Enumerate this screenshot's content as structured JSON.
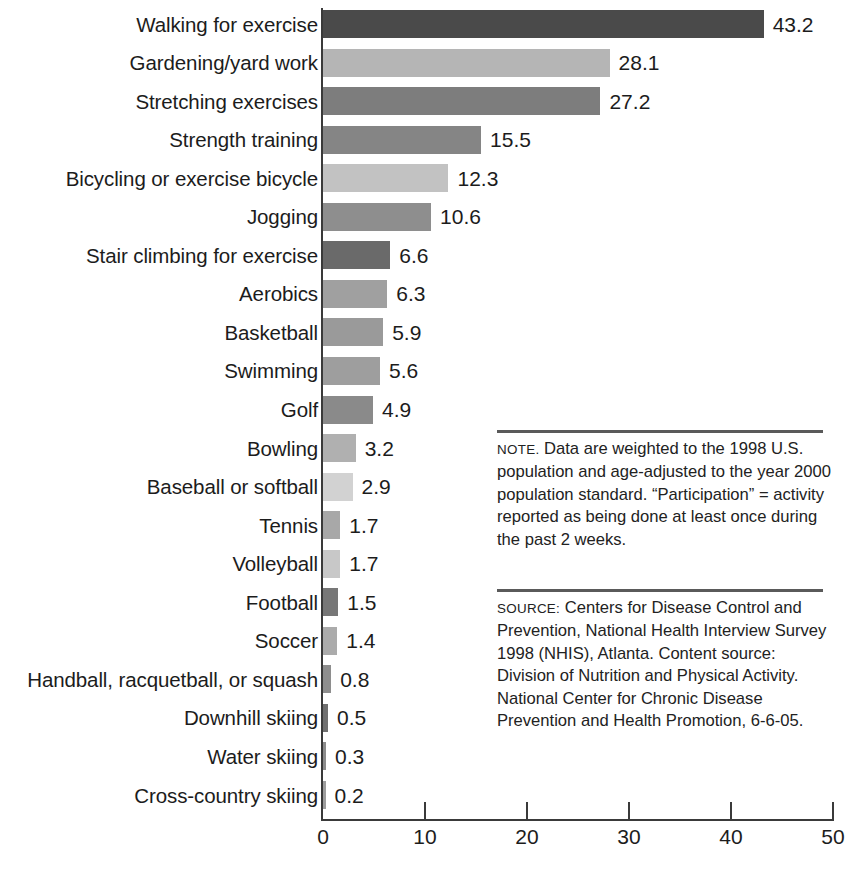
{
  "chart_data": {
    "type": "bar",
    "orientation": "horizontal",
    "title": "",
    "xlabel": "",
    "ylabel": "",
    "xlim": [
      0,
      50
    ],
    "xticks": [
      0,
      10,
      20,
      30,
      40,
      50
    ],
    "xtick_labels": [
      "0",
      "10",
      "20",
      "30",
      "40",
      "50"
    ],
    "grid": false,
    "legend": false,
    "categories": [
      "Walking for exercise",
      "Gardening/yard work",
      "Stretching exercises",
      "Strength training",
      "Bicycling or exercise bicycle",
      "Jogging",
      "Stair climbing for exercise",
      "Aerobics",
      "Basketball",
      "Swimming",
      "Golf",
      "Bowling",
      "Baseball or softball",
      "Tennis",
      "Volleyball",
      "Football",
      "Soccer",
      "Handball, racquetball, or squash",
      "Downhill skiing",
      "Water skiing",
      "Cross-country skiing"
    ],
    "values": [
      43.2,
      28.1,
      27.2,
      15.5,
      12.3,
      10.6,
      6.6,
      6.3,
      5.9,
      5.6,
      4.9,
      3.2,
      2.9,
      1.7,
      1.7,
      1.5,
      1.4,
      0.8,
      0.5,
      0.3,
      0.2
    ],
    "value_labels": [
      "43.2",
      "28.1",
      "27.2",
      "15.5",
      "12.3",
      "10.6",
      "6.6",
      "6.3",
      "5.9",
      "5.6",
      "4.9",
      "3.2",
      "2.9",
      "1.7",
      "1.7",
      "1.5",
      "1.4",
      "0.8",
      "0.5",
      "0.3",
      "0.2"
    ],
    "bar_colors": [
      "#4a4a4a",
      "#b5b5b5",
      "#7d7d7d",
      "#858585",
      "#c2c2c2",
      "#8e8e8e",
      "#6a6a6a",
      "#a0a0a0",
      "#9a9a9a",
      "#9e9e9e",
      "#8a8a8a",
      "#b0b0b0",
      "#d2d2d2",
      "#a8a8a8",
      "#c8c8c8",
      "#777777",
      "#ababab",
      "#8e8e8e",
      "#707070",
      "#8c8c8c",
      "#9d9d9d"
    ]
  },
  "axis": {
    "tick_labels": [
      "0",
      "10",
      "20",
      "30",
      "40",
      "50"
    ]
  },
  "note": {
    "prefix": "NOTE.",
    "text": " Data are weighted to the 1998 U.S. population and age-adjusted to the year 2000 population standard. “Participation” = activity reported as being done at least once during the past 2 weeks."
  },
  "source": {
    "prefix": "SOURCE:",
    "text": "  Centers for Disease Control and Prevention, National Health Interview Survey 1998 (NHIS), Atlanta. Content source: Division of Nutrition and Physical Activity. National Center for Chronic Disease Prevention and Health Promotion, 6-6-05."
  }
}
